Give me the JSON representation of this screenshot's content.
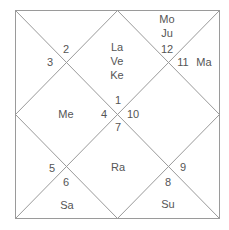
{
  "chart_type": "North Indian Rasi (birth) chart",
  "colors": {
    "line": "#9a9a9a",
    "text": "#555555",
    "background": "#ffffff"
  },
  "houses": [
    {
      "house": 1,
      "sign": "1",
      "planets": [
        "La",
        "Ve",
        "Ke"
      ]
    },
    {
      "house": 2,
      "sign": "12",
      "planets": [
        "Mo",
        "Ju"
      ]
    },
    {
      "house": 3,
      "sign": "11",
      "planets": [
        "Ma"
      ]
    },
    {
      "house": 4,
      "sign": "10",
      "planets": []
    },
    {
      "house": 5,
      "sign": "9",
      "planets": []
    },
    {
      "house": 6,
      "sign": "8",
      "planets": [
        "Su"
      ]
    },
    {
      "house": 7,
      "sign": "7",
      "planets": [
        "Ra"
      ]
    },
    {
      "house": 8,
      "sign": "6",
      "planets": [
        "Sa"
      ]
    },
    {
      "house": 9,
      "sign": "5",
      "planets": []
    },
    {
      "house": 10,
      "sign": "4",
      "planets": [
        "Me"
      ]
    },
    {
      "house": 11,
      "sign": "3",
      "planets": []
    },
    {
      "house": 12,
      "sign": "2",
      "planets": []
    }
  ],
  "labels": {
    "sign_1": "1",
    "sign_2": "2",
    "sign_3": "3",
    "sign_4": "4",
    "sign_5": "5",
    "sign_6": "6",
    "sign_7": "7",
    "sign_8": "8",
    "sign_9": "9",
    "sign_10": "10",
    "sign_11": "11",
    "sign_12": "12",
    "planet_la": "La",
    "planet_ve": "Ve",
    "planet_ke": "Ke",
    "planet_mo": "Mo",
    "planet_ju": "Ju",
    "planet_ma": "Ma",
    "planet_me": "Me",
    "planet_ra": "Ra",
    "planet_sa": "Sa",
    "planet_su": "Su"
  }
}
